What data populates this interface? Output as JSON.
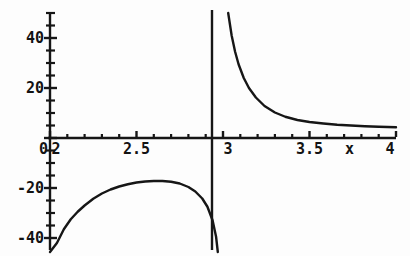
{
  "chart_data": {
    "type": "line",
    "title": "",
    "subtitle": "",
    "xlabel": "x",
    "ylabel": "",
    "xlim": [
      2,
      4
    ],
    "ylim": [
      -50,
      50
    ],
    "grid": false,
    "legend": null,
    "axis_style": "centered-cross-with-minor-ticks",
    "asymptote": {
      "type": "vertical",
      "x": 3,
      "label": ""
    },
    "x_ticks_major": [
      {
        "value": 2,
        "label": "2"
      },
      {
        "value": 2.5,
        "label": "2.5"
      },
      {
        "value": 3,
        "label": "3"
      },
      {
        "value": 3.5,
        "label": "3.5"
      },
      {
        "value": 4,
        "label": "4"
      }
    ],
    "y_ticks_major": [
      {
        "value": 40,
        "label": "40"
      },
      {
        "value": 20,
        "label": "20"
      },
      {
        "value": 0,
        "label": "0"
      },
      {
        "value": -20,
        "label": "-20"
      },
      {
        "value": -40,
        "label": "-40"
      }
    ],
    "x_minor_tick_step": 0.1,
    "y_minor_tick_step": 5,
    "series": [
      {
        "name": "left-branch",
        "x": [
          2.0,
          2.04,
          2.08,
          2.12,
          2.16,
          2.2,
          2.25,
          2.3,
          2.35,
          2.4,
          2.45,
          2.5,
          2.55,
          2.6,
          2.65,
          2.7,
          2.75,
          2.8,
          2.84,
          2.88,
          2.91,
          2.94,
          2.96,
          2.97
        ],
        "values": [
          -50.0,
          -42.0,
          -36.5,
          -32.5,
          -29.5,
          -27.0,
          -24.3,
          -22.2,
          -20.6,
          -19.4,
          -18.5,
          -17.8,
          -17.4,
          -17.2,
          -17.2,
          -17.5,
          -18.2,
          -19.6,
          -21.4,
          -24.2,
          -27.5,
          -33.0,
          -39.5,
          -50.0
        ]
      },
      {
        "name": "right-branch",
        "x": [
          3.03,
          3.05,
          3.07,
          3.09,
          3.12,
          3.15,
          3.19,
          3.24,
          3.3,
          3.36,
          3.43,
          3.5,
          3.58,
          3.66,
          3.74,
          3.82,
          3.9,
          4.0
        ],
        "values": [
          50.0,
          41.0,
          34.5,
          29.5,
          24.0,
          20.0,
          16.2,
          12.8,
          10.2,
          8.5,
          7.2,
          6.4,
          5.8,
          5.3,
          5.0,
          4.7,
          4.5,
          4.3
        ]
      }
    ],
    "colors": {
      "curve": "#161616",
      "axis": "#161616",
      "background": "#fdfdfd",
      "text": "#131313"
    },
    "curve_width_px": 2.4,
    "axis_width_px": 2.4
  }
}
